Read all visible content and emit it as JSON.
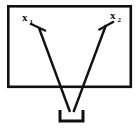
{
  "figure": {
    "background_color": "#ffffff",
    "stroke_color": "#111111",
    "width": 140,
    "height": 130
  },
  "enclosure": {
    "name": "outer-rectangle",
    "x": 7,
    "y": 5,
    "width": 125,
    "height": 83,
    "stroke_width": 2.6
  },
  "labels": {
    "left": {
      "base": "x",
      "subscript": "1",
      "x": 22,
      "y": 21
    },
    "right": {
      "base": "x",
      "subscript": "2",
      "x": 110,
      "y": 19
    }
  },
  "paths": {
    "left_line": {
      "name": "left-ray",
      "x1": 39,
      "y1": 28,
      "x2": 70,
      "y2": 112,
      "stroke_width": 2.4
    },
    "right_line": {
      "name": "right-ray",
      "x1": 106,
      "y1": 25,
      "x2": 73,
      "y2": 112,
      "stroke_width": 2.4
    },
    "left_barb": {
      "name": "left-arrow-barb",
      "x1": 30,
      "y1": 24,
      "x2": 46,
      "y2": 31,
      "stroke_width": 2.2
    },
    "right_barb": {
      "name": "right-arrow-barb",
      "x1": 99,
      "y1": 30,
      "x2": 114,
      "y2": 22,
      "stroke_width": 2.2
    }
  },
  "container": {
    "name": "u-bracket-vessel",
    "left_x": 60,
    "right_x": 83,
    "top_y": 110,
    "bottom_y": 122,
    "stroke_width": 3.0
  }
}
